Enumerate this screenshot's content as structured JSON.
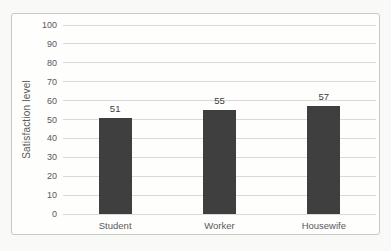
{
  "chart_data": {
    "type": "bar",
    "categories": [
      "Student",
      "Worker",
      "Housewife"
    ],
    "values": [
      51,
      55,
      57
    ],
    "data_labels": [
      "51",
      "55",
      "57"
    ],
    "title": "",
    "xlabel": "",
    "ylabel": "Satisfaction level",
    "ylim": [
      0,
      100
    ],
    "yticks": [
      0,
      10,
      20,
      30,
      40,
      50,
      60,
      70,
      80,
      90,
      100
    ],
    "grid": true,
    "legend": false,
    "bar_color": "#3f3f3f",
    "gridline_color": "#d9d9d9",
    "tick_label_color": "#595959",
    "frame_border_color": "#c9c9c4",
    "background_color": "#fefefd"
  }
}
